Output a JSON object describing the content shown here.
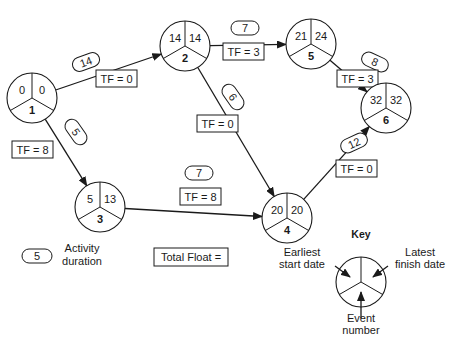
{
  "diagram": {
    "type": "activity-on-node network (critical path)",
    "nodes": [
      {
        "id": "1",
        "event_number": "1",
        "earliest_start": "0",
        "latest_finish": "0",
        "cx": 32,
        "cy": 98
      },
      {
        "id": "2",
        "event_number": "2",
        "earliest_start": "14",
        "latest_finish": "14",
        "cx": 185,
        "cy": 46
      },
      {
        "id": "5",
        "event_number": "5",
        "earliest_start": "21",
        "latest_finish": "24",
        "cx": 311,
        "cy": 44
      },
      {
        "id": "3",
        "event_number": "3",
        "earliest_start": "5",
        "latest_finish": "13",
        "cx": 100,
        "cy": 207
      },
      {
        "id": "4",
        "event_number": "4",
        "earliest_start": "20",
        "latest_finish": "20",
        "cx": 287,
        "cy": 218
      },
      {
        "id": "6",
        "event_number": "6",
        "earliest_start": "32",
        "latest_finish": "32",
        "cx": 386,
        "cy": 108
      }
    ],
    "activities": [
      {
        "from": "1",
        "to": "2",
        "duration": "14",
        "total_float": "TF = 0",
        "pill": {
          "x": 86,
          "y": 62,
          "angle": -20
        },
        "box": {
          "x": 96,
          "y": 70
        }
      },
      {
        "from": "1",
        "to": "3",
        "duration": "5",
        "total_float": "TF = 8",
        "pill": {
          "x": 76,
          "y": 132,
          "angle": 55
        },
        "box": {
          "x": 12,
          "y": 141
        }
      },
      {
        "from": "2",
        "to": "5",
        "duration": "7",
        "total_float": "TF = 3",
        "pill": {
          "x": 245,
          "y": 28,
          "angle": 0
        },
        "box": {
          "x": 223,
          "y": 43
        }
      },
      {
        "from": "2",
        "to": "4",
        "duration": "6",
        "total_float": "TF = 0",
        "pill": {
          "x": 233,
          "y": 97,
          "angle": 55
        },
        "box": {
          "x": 197,
          "y": 115
        }
      },
      {
        "from": "3",
        "to": "4",
        "duration": "7",
        "total_float": "TF = 8",
        "pill": {
          "x": 199,
          "y": 173,
          "angle": 0
        },
        "box": {
          "x": 180,
          "y": 188
        }
      },
      {
        "from": "5",
        "to": "6",
        "duration": "8",
        "total_float": "TF = 3",
        "pill": {
          "x": 375,
          "y": 62,
          "angle": 25
        },
        "box": {
          "x": 337,
          "y": 70
        }
      },
      {
        "from": "4",
        "to": "6",
        "duration": "12",
        "total_float": "TF = 0",
        "pill": {
          "x": 354,
          "y": 143,
          "angle": -25
        },
        "box": {
          "x": 336,
          "y": 160
        }
      }
    ],
    "legend": {
      "duration_sample": "5",
      "duration_label_line1": "Activity",
      "duration_label_line2": "duration",
      "float_label": "Total Float ="
    },
    "key": {
      "title": "Key",
      "earliest_line1": "Earliest",
      "earliest_line2": "start date",
      "latest_line1": "Latest",
      "latest_line2": "finish date",
      "event_line1": "Event",
      "event_line2": "number"
    },
    "colors": {
      "line": "#1a1a1a",
      "background": "#ffffff"
    }
  }
}
